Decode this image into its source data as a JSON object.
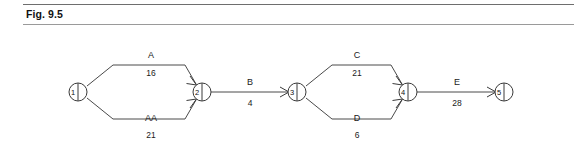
{
  "figure": {
    "label": "Fig. 9.5"
  },
  "diagram": {
    "type": "activity-on-arrow-network",
    "nodes": [
      {
        "id": "1",
        "label": "1",
        "cx": 78,
        "cy": 66
      },
      {
        "id": "2",
        "label": "2",
        "cx": 202,
        "cy": 66
      },
      {
        "id": "3",
        "label": "3",
        "cx": 297,
        "cy": 66
      },
      {
        "id": "4",
        "label": "4",
        "cx": 408,
        "cy": 66
      },
      {
        "id": "5",
        "label": "5",
        "cx": 504,
        "cy": 66
      }
    ],
    "activities": [
      {
        "name": "A",
        "duration": "16",
        "from": "1",
        "to": "2",
        "branch": "upper",
        "name_x": 151,
        "name_y": 32,
        "dur_x": 151,
        "dur_y": 50
      },
      {
        "name": "AA",
        "duration": "21",
        "from": "1",
        "to": "2",
        "branch": "lower",
        "name_x": 151,
        "name_y": 95,
        "dur_x": 151,
        "dur_y": 112
      },
      {
        "name": "B",
        "duration": "4",
        "from": "2",
        "to": "3",
        "branch": "straight",
        "name_x": 250,
        "name_y": 59,
        "dur_x": 250,
        "dur_y": 80
      },
      {
        "name": "C",
        "duration": "21",
        "from": "3",
        "to": "4",
        "branch": "upper",
        "name_x": 357,
        "name_y": 32,
        "dur_x": 357,
        "dur_y": 50
      },
      {
        "name": "D",
        "duration": "6",
        "from": "3",
        "to": "4",
        "branch": "lower",
        "name_x": 357,
        "name_y": 95,
        "dur_x": 357,
        "dur_y": 112
      },
      {
        "name": "E",
        "duration": "28",
        "from": "4",
        "to": "5",
        "branch": "straight",
        "name_x": 457,
        "name_y": 59,
        "dur_x": 457,
        "dur_y": 80
      }
    ]
  },
  "colors": {
    "background": "#ffffff",
    "line": "#4a4a4a",
    "node_stroke": "#3a3a3a",
    "text": "#1a1a1a",
    "rule": "#8a8a8a"
  }
}
